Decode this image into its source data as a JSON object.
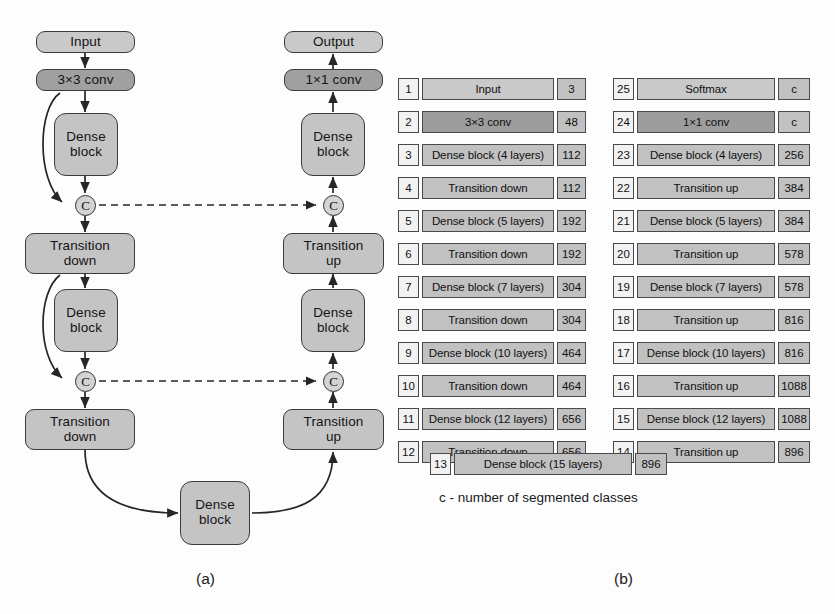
{
  "figure": {
    "caption_a": "(a)",
    "caption_b": "(b)",
    "legend": "c - number of segmented classes"
  },
  "diagram_a": {
    "down_path": {
      "input": "Input",
      "conv": "3×3 conv",
      "dense1_l1": "Dense",
      "dense1_l2": "block",
      "td1_l1": "Transition",
      "td1_l2": "down",
      "dense2_l1": "Dense",
      "dense2_l2": "block",
      "td2_l1": "Transition",
      "td2_l2": "down"
    },
    "bottleneck": {
      "l1": "Dense",
      "l2": "block"
    },
    "up_path": {
      "output": "Output",
      "conv": "1×1 conv",
      "dense1_l1": "Dense",
      "dense1_l2": "block",
      "tu1_l1": "Transition",
      "tu1_l2": "up",
      "dense2_l1": "Dense",
      "dense2_l2": "block",
      "tu2_l1": "Transition",
      "tu2_l2": "up"
    },
    "concat_glyph": "C"
  },
  "table_left": {
    "rows": [
      {
        "index": "1",
        "name": "Input",
        "channels": "3",
        "style": "light"
      },
      {
        "index": "2",
        "name": "3×3 conv",
        "channels": "48",
        "style": "dark"
      },
      {
        "index": "3",
        "name": "Dense block (4 layers)",
        "channels": "112",
        "style": "mid"
      },
      {
        "index": "4",
        "name": "Transition down",
        "channels": "112",
        "style": "mid"
      },
      {
        "index": "5",
        "name": "Dense block (5 layers)",
        "channels": "192",
        "style": "mid"
      },
      {
        "index": "6",
        "name": "Transition down",
        "channels": "192",
        "style": "mid"
      },
      {
        "index": "7",
        "name": "Dense block (7 layers)",
        "channels": "304",
        "style": "mid"
      },
      {
        "index": "8",
        "name": "Transition down",
        "channels": "304",
        "style": "mid"
      },
      {
        "index": "9",
        "name": "Dense block (10 layers)",
        "channels": "464",
        "style": "mid"
      },
      {
        "index": "10",
        "name": "Transition down",
        "channels": "464",
        "style": "mid"
      },
      {
        "index": "11",
        "name": "Dense block (12 layers)",
        "channels": "656",
        "style": "mid"
      },
      {
        "index": "12",
        "name": "Transition down",
        "channels": "656",
        "style": "mid"
      }
    ]
  },
  "table_right": {
    "rows": [
      {
        "index": "25",
        "name": "Softmax",
        "channels": "c",
        "style": "light"
      },
      {
        "index": "24",
        "name": "1×1 conv",
        "channels": "c",
        "style": "dark"
      },
      {
        "index": "23",
        "name": "Dense block (4 layers)",
        "channels": "256",
        "style": "mid"
      },
      {
        "index": "22",
        "name": "Transition up",
        "channels": "384",
        "style": "mid"
      },
      {
        "index": "21",
        "name": "Dense block (5 layers)",
        "channels": "384",
        "style": "mid"
      },
      {
        "index": "20",
        "name": "Transition up",
        "channels": "578",
        "style": "mid"
      },
      {
        "index": "19",
        "name": "Dense block (7 layers)",
        "channels": "578",
        "style": "mid"
      },
      {
        "index": "18",
        "name": "Transition up",
        "channels": "816",
        "style": "mid"
      },
      {
        "index": "17",
        "name": "Dense block (10 layers)",
        "channels": "816",
        "style": "mid"
      },
      {
        "index": "16",
        "name": "Transition up",
        "channels": "1088",
        "style": "mid"
      },
      {
        "index": "15",
        "name": "Dense block (12 layers)",
        "channels": "1088",
        "style": "mid"
      },
      {
        "index": "14",
        "name": "Transition up",
        "channels": "896",
        "style": "mid"
      }
    ]
  },
  "table_bottom": {
    "index": "13",
    "name": "Dense block (15 layers)",
    "channels": "896"
  },
  "colors": {
    "block_light": "#c9c9c9",
    "block_mid": "#c1c1c1",
    "block_dark": "#9d9d9d",
    "index_bg": "#f2f2f2",
    "stroke": "#3b3b3b",
    "background": "#fdfdfd"
  }
}
